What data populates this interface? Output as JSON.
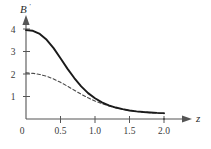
{
  "chart_data": {
    "type": "line",
    "title": "",
    "subtitle": "",
    "xlabel": "z",
    "ylabel": "B'",
    "xlim": [
      0,
      2.25
    ],
    "ylim": [
      0,
      4.4
    ],
    "grid": false,
    "legend": "none",
    "x_ticks": [
      0,
      0.5,
      1.0,
      1.5,
      2.0
    ],
    "x_tick_labels": [
      "0",
      "0.5",
      "1.0",
      "1.5",
      "2.0"
    ],
    "y_ticks": [
      0,
      1,
      2,
      3,
      4
    ],
    "y_tick_labels": [
      "0",
      "1",
      "2",
      "3",
      "4"
    ],
    "annotations": [],
    "series": [
      {
        "name": "solid-curve",
        "style": "solid",
        "color": "#1a1a1a",
        "x": [
          0.0,
          0.1,
          0.2,
          0.3,
          0.4,
          0.5,
          0.6,
          0.7,
          0.8,
          0.9,
          1.0,
          1.1,
          1.2,
          1.3,
          1.4,
          1.5,
          1.6,
          1.7,
          1.8,
          1.9,
          2.0
        ],
        "values": [
          3.95,
          3.92,
          3.78,
          3.52,
          3.15,
          2.7,
          2.24,
          1.82,
          1.45,
          1.15,
          0.92,
          0.74,
          0.61,
          0.51,
          0.44,
          0.38,
          0.34,
          0.31,
          0.29,
          0.27,
          0.26
        ]
      },
      {
        "name": "dashed-curve",
        "style": "dashed",
        "color": "#4a4a4a",
        "x": [
          0.0,
          0.1,
          0.2,
          0.3,
          0.4,
          0.5,
          0.6,
          0.7,
          0.8,
          0.9,
          1.0,
          1.1,
          1.2,
          1.3,
          1.4,
          1.5,
          1.6,
          1.7,
          1.8,
          1.9,
          2.0
        ],
        "values": [
          2.05,
          2.03,
          1.98,
          1.9,
          1.78,
          1.63,
          1.46,
          1.28,
          1.1,
          0.94,
          0.8,
          0.68,
          0.58,
          0.5,
          0.43,
          0.38,
          0.34,
          0.31,
          0.28,
          0.26,
          0.24
        ]
      }
    ]
  },
  "axes": {
    "y_axis_label": "B",
    "y_axis_prime": "′",
    "x_axis_label": "z"
  },
  "ticks": {
    "x": [
      {
        "value": "0"
      },
      {
        "value": "0.5"
      },
      {
        "value": "1.0"
      },
      {
        "value": "1.5"
      },
      {
        "value": "2.0"
      }
    ],
    "y": [
      {
        "value": "1"
      },
      {
        "value": "2"
      },
      {
        "value": "3"
      },
      {
        "value": "4"
      }
    ]
  }
}
